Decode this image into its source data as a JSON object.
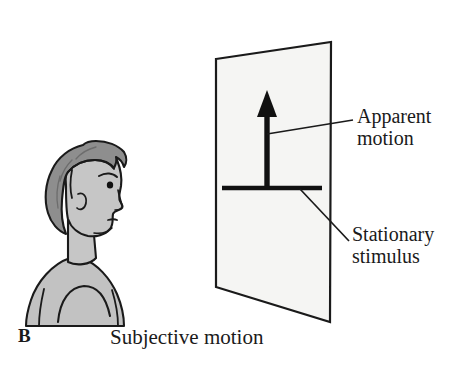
{
  "figure": {
    "panel_letter": "B",
    "caption": "Subjective motion",
    "background_color": "#ffffff",
    "ink_color": "#1a1a1a"
  },
  "labels": {
    "apparent_motion": {
      "line1": "Apparent",
      "line2": "motion",
      "leader_from": [
        267,
        134
      ],
      "leader_to": [
        353,
        120
      ]
    },
    "stationary_stimulus": {
      "line1": "Stationary",
      "line2": "stimulus",
      "leader_from": [
        300,
        189
      ],
      "leader_to": [
        349,
        241
      ]
    }
  },
  "observer": {
    "description": "Side profile of a person facing right",
    "hair_color": "#8e8e8e",
    "skin_color": "#c6c6c6",
    "body_color": "#c2c2c2",
    "outline_color": "#1a1a1a"
  },
  "screen": {
    "description": "Rectangular display panel shown in perspective",
    "fill_color": "#f5f5f3",
    "outline_color": "#1a1a1a",
    "corners": [
      [
        216,
        59
      ],
      [
        331,
        42
      ],
      [
        330,
        322
      ],
      [
        216,
        287
      ]
    ]
  },
  "stimuli": {
    "arrow": {
      "name": "upward motion arrow",
      "color": "#111111",
      "shaft_x": 267,
      "tip_y": 92,
      "base_y": 188
    },
    "bar": {
      "name": "horizontal stationary bar",
      "color": "#111111",
      "x_start": 222,
      "x_end": 322,
      "y": 188
    }
  }
}
